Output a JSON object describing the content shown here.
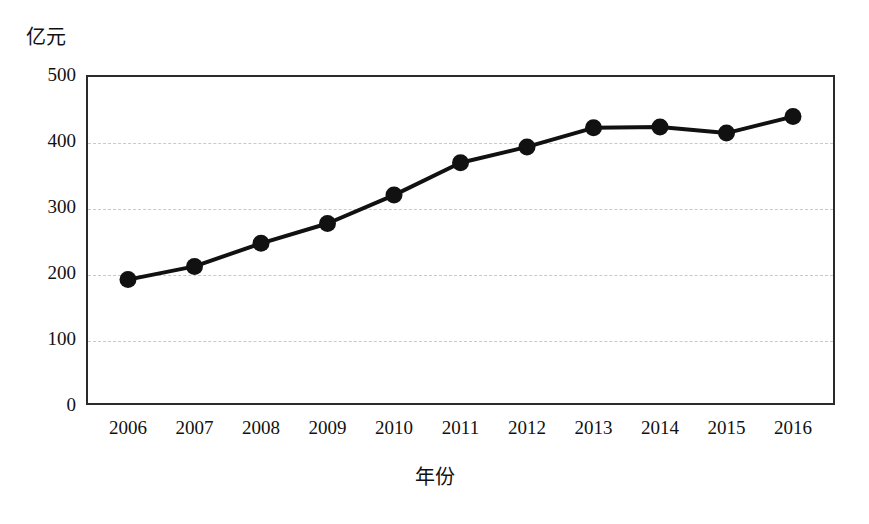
{
  "chart_data": {
    "type": "line",
    "title": "",
    "subtitle": "",
    "xlabel": "年份",
    "ylabel": "亿元",
    "unit_label": "亿元",
    "categories": [
      "2006",
      "2007",
      "2008",
      "2009",
      "2010",
      "2011",
      "2012",
      "2013",
      "2014",
      "2015",
      "2016"
    ],
    "x": [
      2006,
      2007,
      2008,
      2009,
      2010,
      2011,
      2012,
      2013,
      2014,
      2015,
      2016
    ],
    "values": [
      190,
      210,
      245,
      275,
      318,
      367,
      391,
      420,
      421,
      412,
      437
    ],
    "series": [
      {
        "name": "亿元",
        "values": [
          190,
          210,
          245,
          275,
          318,
          367,
          391,
          420,
          421,
          412,
          437
        ]
      }
    ],
    "ylim": [
      0,
      500
    ],
    "yticks": [
      0,
      100,
      200,
      300,
      400,
      500
    ],
    "ytick_labels": [
      "0",
      "100",
      "200",
      "300",
      "400",
      "500"
    ],
    "xtick_labels": [
      "2006",
      "2007",
      "2008",
      "2009",
      "2010",
      "2011",
      "2012",
      "2013",
      "2014",
      "2015",
      "2016"
    ],
    "grid": "horizontal-dashed",
    "legend": "none",
    "marker": "filled-circle",
    "line_color": "#111111",
    "marker_color": "#111111",
    "grid_color": "#c9c9c9",
    "frame_color": "#2b2b2b",
    "background": "#ffffff",
    "annotations": []
  },
  "axis": {
    "y_unit": "亿元",
    "x_title": "年份"
  }
}
